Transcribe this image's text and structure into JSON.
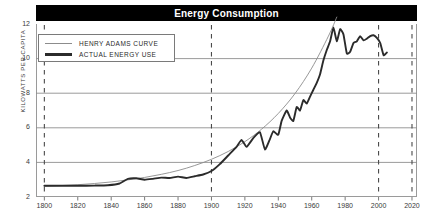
{
  "chart": {
    "title": "Energy Consumption"
  },
  "legend": {
    "position": "top-left",
    "entries": [
      {
        "label": "HENRY ADAMS CURVE",
        "style": "thin",
        "color": "#8c8c8c"
      },
      {
        "label": "ACTUAL ENERGY USE",
        "style": "thick",
        "color": "#2b2b2b"
      }
    ]
  },
  "axes": {
    "ylabel": "KILOWATTS PER CAPITA",
    "yticks": [
      "2",
      "4",
      "6",
      "8",
      "10",
      "12"
    ],
    "xticks": [
      "1800",
      "1820",
      "1840",
      "1860",
      "1880",
      "1900",
      "1920",
      "1940",
      "1960",
      "1980",
      "2000",
      "2020"
    ]
  },
  "colors": {
    "banner_bg": "#000000",
    "banner_text": "#ffffff",
    "grid": "#8e8e8e",
    "frame": "#9a9a9a",
    "actual_line": "#2b2b2b",
    "adams_line": "#8c8c8c",
    "dashed_marker": "#4a4a4a"
  },
  "chart_data": {
    "type": "line",
    "title": "Energy Consumption",
    "xlabel": "",
    "ylabel": "KILOWATTS PER CAPITA",
    "xlim": [
      1795,
      2023
    ],
    "ylim": [
      2,
      12
    ],
    "grid": true,
    "gridlines_y": [
      4,
      6,
      8,
      10
    ],
    "vertical_markers": [
      1800,
      1900,
      2000,
      2020
    ],
    "legend_position": "top-left",
    "series": [
      {
        "name": "HENRY ADAMS CURVE",
        "style": "thin",
        "color": "#8c8c8c",
        "note": "smooth exponential reference curve",
        "x": [
          1800,
          1810,
          1820,
          1830,
          1840,
          1850,
          1860,
          1870,
          1880,
          1890,
          1900,
          1910,
          1920,
          1930,
          1940,
          1950,
          1960,
          1970,
          1975
        ],
        "y": [
          2.62,
          2.66,
          2.71,
          2.78,
          2.87,
          2.99,
          3.13,
          3.31,
          3.53,
          3.82,
          4.18,
          4.63,
          5.2,
          5.92,
          6.83,
          7.98,
          9.45,
          11.3,
          12.4
        ]
      },
      {
        "name": "ACTUAL ENERGY USE",
        "style": "thick",
        "color": "#2b2b2b",
        "x": [
          1800,
          1810,
          1820,
          1830,
          1838,
          1845,
          1850,
          1855,
          1860,
          1865,
          1870,
          1875,
          1880,
          1885,
          1890,
          1895,
          1900,
          1905,
          1910,
          1915,
          1918,
          1921,
          1925,
          1929,
          1932,
          1935,
          1937,
          1940,
          1942,
          1945,
          1947,
          1949,
          1951,
          1953,
          1955,
          1957,
          1959,
          1961,
          1963,
          1965,
          1967,
          1969,
          1971,
          1973,
          1975,
          1977,
          1979,
          1981,
          1983,
          1985,
          1987,
          1989,
          1991,
          1993,
          1995,
          1997,
          1999,
          2001,
          2003,
          2005
        ],
        "y": [
          2.65,
          2.65,
          2.65,
          2.66,
          2.68,
          2.78,
          3.05,
          3.08,
          3.0,
          3.05,
          3.12,
          3.1,
          3.18,
          3.1,
          3.2,
          3.3,
          3.5,
          3.9,
          4.4,
          4.9,
          5.3,
          4.9,
          5.4,
          5.75,
          4.75,
          5.35,
          5.8,
          5.6,
          6.4,
          7.0,
          6.6,
          6.4,
          7.2,
          7.0,
          7.6,
          7.4,
          7.8,
          8.2,
          8.6,
          9.1,
          9.9,
          10.5,
          11.0,
          11.8,
          11.0,
          11.7,
          11.4,
          10.3,
          10.4,
          10.9,
          11.0,
          11.3,
          11.05,
          11.15,
          11.3,
          11.35,
          11.2,
          10.9,
          10.2,
          10.35
        ]
      }
    ]
  }
}
